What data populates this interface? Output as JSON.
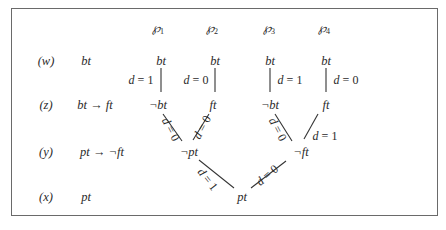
{
  "figure": {
    "columns": [
      {
        "symbol": "℘",
        "index": "1"
      },
      {
        "symbol": "℘",
        "index": "2"
      },
      {
        "symbol": "℘",
        "index": "3"
      },
      {
        "symbol": "℘",
        "index": "4"
      }
    ],
    "rows": [
      {
        "tag": "(w)",
        "formula": "bt"
      },
      {
        "tag": "(z)",
        "formula": "bt → ft"
      },
      {
        "tag": "(y)",
        "formula": "pt → ¬ft"
      },
      {
        "tag": "(x)",
        "formula": "pt"
      }
    ],
    "nodes": {
      "w1": "bt",
      "w2": "bt",
      "w3": "bt",
      "w4": "bt",
      "z1": "¬bt",
      "z2": "ft",
      "z3": "¬bt",
      "z4": "ft",
      "y_left": "¬pt",
      "y_right": "¬ft",
      "x_root": "pt"
    },
    "edges": {
      "w1_z1": {
        "var": "d",
        "eq": " = ",
        "val": "1"
      },
      "w2_z2": {
        "var": "d",
        "eq": " = ",
        "val": "0"
      },
      "w3_z3": {
        "var": "d",
        "eq": " = ",
        "val": "1"
      },
      "w4_z4": {
        "var": "d",
        "eq": " = ",
        "val": "0"
      },
      "z1_yl": {
        "var": "d",
        "eq": " = ",
        "val": "0"
      },
      "z2_yl": {
        "var": "d",
        "eq": " = ",
        "val": "0"
      },
      "z3_yr": {
        "var": "d",
        "eq": " = ",
        "val": "0"
      },
      "z4_yr": {
        "var": "d",
        "eq": " = ",
        "val": "1"
      },
      "yl_x": {
        "var": "d",
        "eq": " = ",
        "val": "1"
      },
      "yr_x": {
        "var": "d",
        "eq": " = ",
        "val": "0"
      }
    }
  }
}
